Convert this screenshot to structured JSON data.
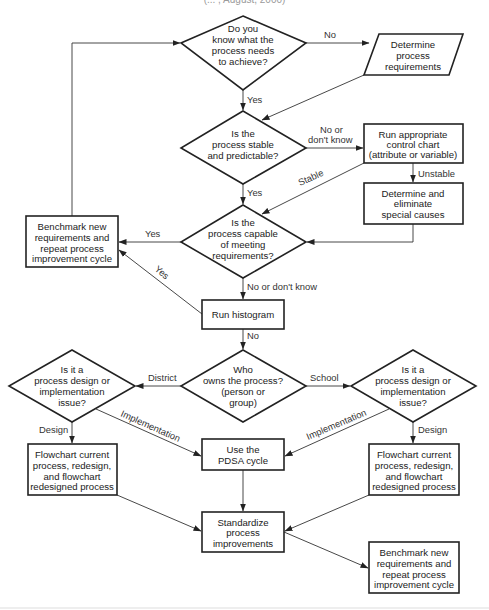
{
  "caption": "(... , August, 2000)",
  "colors": {
    "stroke": "#222222",
    "background": "#ffffff",
    "text": "#222222"
  },
  "nodes": {
    "d1": {
      "type": "decision",
      "lines": [
        "Do you",
        "know what the",
        "process needs",
        "to achieve?"
      ]
    },
    "p1": {
      "type": "io-parallelogram",
      "lines": [
        "Determine",
        "process",
        "requirements"
      ]
    },
    "d2": {
      "type": "decision",
      "lines": [
        "Is the",
        "process stable",
        "and predictable?"
      ]
    },
    "b1": {
      "type": "process",
      "lines": [
        "Run appropriate",
        "control chart",
        "(attribute or variable)"
      ]
    },
    "b2": {
      "type": "process",
      "lines": [
        "Determine and",
        "eliminate",
        "special causes"
      ]
    },
    "d3": {
      "type": "decision",
      "lines": [
        "Is the",
        "process capable",
        "of meeting",
        "requirements?"
      ]
    },
    "bench1": {
      "type": "process",
      "lines": [
        "Benchmark new",
        "requirements and",
        "repeat process",
        "improvement cycle"
      ]
    },
    "hist": {
      "type": "process",
      "lines": [
        "Run histogram"
      ]
    },
    "d4": {
      "type": "decision",
      "lines": [
        "Who",
        "owns the process?",
        "(person or",
        "group)"
      ]
    },
    "d5": {
      "type": "decision",
      "lines": [
        "Is it a",
        "process design or",
        "implementation",
        "issue?"
      ]
    },
    "d6": {
      "type": "decision",
      "lines": [
        "Is it a",
        "process design or",
        "implementation",
        "issue?"
      ]
    },
    "fc1": {
      "type": "process",
      "lines": [
        "Flowchart current",
        "process, redesign,",
        "and flowchart",
        "redesigned process"
      ]
    },
    "fc2": {
      "type": "process",
      "lines": [
        "Flowchart current",
        "process, redesign,",
        "and flowchart",
        "redesigned process"
      ]
    },
    "pdsa": {
      "type": "process",
      "lines": [
        "Use the",
        "PDSA cycle"
      ]
    },
    "std": {
      "type": "process",
      "lines": [
        "Standardize",
        "process",
        "improvements"
      ]
    },
    "bench2": {
      "type": "process",
      "lines": [
        "Benchmark new",
        "requirements and",
        "repeat process",
        "improvement cycle"
      ]
    }
  },
  "edge_labels": {
    "d1_no": "No",
    "d1_yes": "Yes",
    "d2_no_1": "No or",
    "d2_no_2": "don't know",
    "d2_yes": "Yes",
    "b1_unstable": "Unstable",
    "b1_stable": "Stable",
    "d3_yes": "Yes",
    "d3_no": "No or don't know",
    "hist_yes": "Yes",
    "hist_no": "No",
    "d4_district": "District",
    "d4_school": "School",
    "d5_design": "Design",
    "d5_impl": "Implementation",
    "d6_design": "Design",
    "d6_impl": "Implementation"
  }
}
